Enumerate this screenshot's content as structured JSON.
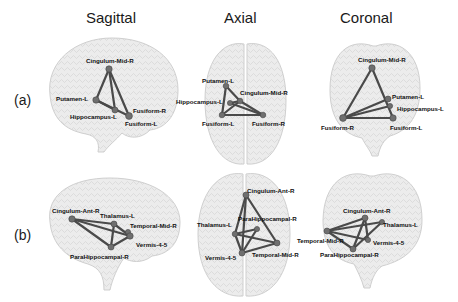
{
  "columns": [
    "Sagittal",
    "Axial",
    "Coronal"
  ],
  "rows": [
    "(a)",
    "(b)"
  ],
  "colors": {
    "edge": "#4a4a4a",
    "node": "#6f6f6f",
    "brain": "#e8e8e8",
    "brain_edge": "#c9c9c9"
  },
  "panels": {
    "a_sagittal": {
      "nodes": [
        {
          "label": "Cingulum-Mid-R",
          "x": 109,
          "y": 69,
          "lx": 86,
          "ly": 63
        },
        {
          "label": "Putamen-L",
          "x": 96,
          "y": 100,
          "lx": 56,
          "ly": 101
        },
        {
          "label": "Hippocampus-L",
          "x": 115,
          "y": 110,
          "lx": 70,
          "ly": 119
        },
        {
          "label": "Fusiform-R",
          "x": 129,
          "y": 116,
          "lx": 133,
          "ly": 113
        },
        {
          "label": "Fusiform-L",
          "x": 128,
          "y": 117,
          "lx": 125,
          "ly": 126
        }
      ]
    },
    "a_axial": {
      "nodes": [
        {
          "label": "Putamen-L",
          "x": 226,
          "y": 86,
          "lx": 202,
          "ly": 83
        },
        {
          "label": "Cingulum-Mid-R",
          "x": 240,
          "y": 101,
          "lx": 240,
          "ly": 95
        },
        {
          "label": "Hippocampus-L",
          "x": 230,
          "y": 103,
          "lx": 176,
          "ly": 104
        },
        {
          "label": "Fusiform-L",
          "x": 222,
          "y": 115,
          "lx": 202,
          "ly": 126
        },
        {
          "label": "Fusiform-R",
          "x": 263,
          "y": 115,
          "lx": 252,
          "ly": 126
        }
      ]
    },
    "a_coronal": {
      "nodes": [
        {
          "label": "Cingulum-Mid-R",
          "x": 372,
          "y": 68,
          "lx": 358,
          "ly": 62
        },
        {
          "label": "Putamen-L",
          "x": 388,
          "y": 99,
          "lx": 392,
          "ly": 99
        },
        {
          "label": "Hippocampus-L",
          "x": 390,
          "y": 106,
          "lx": 397,
          "ly": 111
        },
        {
          "label": "Fusiform-R",
          "x": 343,
          "y": 118,
          "lx": 321,
          "ly": 130
        },
        {
          "label": "Fusiform-L",
          "x": 393,
          "y": 118,
          "lx": 390,
          "ly": 130
        }
      ]
    },
    "b_sagittal": {
      "nodes": [
        {
          "label": "Cingulum-Ant-R",
          "x": 72,
          "y": 219,
          "lx": 52,
          "ly": 213
        },
        {
          "label": "Thalamus-L",
          "x": 114,
          "y": 224,
          "lx": 100,
          "ly": 218
        },
        {
          "label": "Temporal-Mid-R",
          "x": 128,
          "y": 232,
          "lx": 130,
          "ly": 228
        },
        {
          "label": "Vermis-4-5",
          "x": 130,
          "y": 236,
          "lx": 136,
          "ly": 247
        },
        {
          "label": "ParaHippocampal-R",
          "x": 111,
          "y": 247,
          "lx": 70,
          "ly": 259
        }
      ]
    },
    "b_axial": {
      "nodes": [
        {
          "label": "Cingulum-Ant-R",
          "x": 246,
          "y": 195,
          "lx": 247,
          "ly": 193
        },
        {
          "label": "ParaHippocampal-R",
          "x": 257,
          "y": 229,
          "lx": 238,
          "ly": 221
        },
        {
          "label": "Thalamus-L",
          "x": 235,
          "y": 234,
          "lx": 197,
          "ly": 227
        },
        {
          "label": "Temporal-Mid-R",
          "x": 277,
          "y": 243,
          "lx": 252,
          "ly": 257
        },
        {
          "label": "Vermis-4-5",
          "x": 242,
          "y": 253,
          "lx": 205,
          "ly": 260
        }
      ]
    },
    "b_coronal": {
      "nodes": [
        {
          "label": "Cingulum-Ant-R",
          "x": 365,
          "y": 218,
          "lx": 343,
          "ly": 213
        },
        {
          "label": "Thalamus-L",
          "x": 382,
          "y": 222,
          "lx": 383,
          "ly": 227
        },
        {
          "label": "Temporal-Mid-R",
          "x": 327,
          "y": 231,
          "lx": 297,
          "ly": 243
        },
        {
          "label": "Vermis-4-5",
          "x": 368,
          "y": 240,
          "lx": 373,
          "ly": 245
        },
        {
          "label": "ParaHippocampal-R",
          "x": 353,
          "y": 249,
          "lx": 320,
          "ly": 257
        }
      ]
    }
  }
}
